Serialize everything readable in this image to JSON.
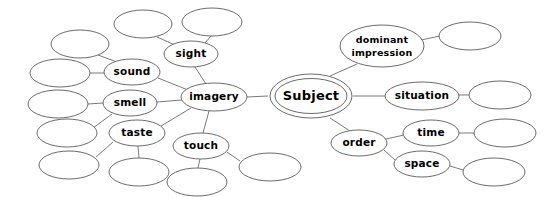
{
  "diagram": {
    "type": "mind-map",
    "background_color": "#ffffff",
    "stroke_color": "#5a5a5a",
    "edge_color": "#6b6b6b",
    "text_color": "#000000",
    "width": 558,
    "height": 197
  },
  "nodes": [
    {
      "id": "subject",
      "label": "Subject",
      "cx": 311,
      "cy": 96,
      "rx": 41,
      "ry": 22,
      "double": true,
      "size": "lg",
      "lines": [
        "Subject"
      ]
    },
    {
      "id": "imagery",
      "label": "imagery",
      "cx": 214,
      "cy": 97,
      "rx": 33,
      "ry": 14,
      "double": false,
      "size": "md",
      "lines": [
        "imagery"
      ]
    },
    {
      "id": "sight",
      "label": "sight",
      "cx": 191,
      "cy": 54,
      "rx": 27,
      "ry": 13,
      "double": false,
      "size": "md",
      "lines": [
        "sight"
      ]
    },
    {
      "id": "sound",
      "label": "sound",
      "cx": 132,
      "cy": 72,
      "rx": 28,
      "ry": 13,
      "double": false,
      "size": "md",
      "lines": [
        "sound"
      ]
    },
    {
      "id": "smell",
      "label": "smell",
      "cx": 130,
      "cy": 103,
      "rx": 27,
      "ry": 13,
      "double": false,
      "size": "md",
      "lines": [
        "smell"
      ]
    },
    {
      "id": "taste",
      "label": "taste",
      "cx": 137,
      "cy": 133,
      "rx": 28,
      "ry": 13,
      "double": false,
      "size": "md",
      "lines": [
        "taste"
      ]
    },
    {
      "id": "touch",
      "label": "touch",
      "cx": 201,
      "cy": 146,
      "rx": 28,
      "ry": 13,
      "double": false,
      "size": "md",
      "lines": [
        "touch"
      ]
    },
    {
      "id": "dominant_impression",
      "label": "dominant impression",
      "cx": 382,
      "cy": 46,
      "rx": 42,
      "ry": 21,
      "double": false,
      "size": "sm",
      "lines": [
        "dominant",
        "impression"
      ]
    },
    {
      "id": "situation",
      "label": "situation",
      "cx": 422,
      "cy": 96,
      "rx": 37,
      "ry": 14,
      "double": false,
      "size": "md",
      "lines": [
        "situation"
      ]
    },
    {
      "id": "order",
      "label": "order",
      "cx": 359,
      "cy": 143,
      "rx": 28,
      "ry": 13,
      "double": false,
      "size": "md",
      "lines": [
        "order"
      ]
    },
    {
      "id": "time",
      "label": "time",
      "cx": 431,
      "cy": 133,
      "rx": 28,
      "ry": 13,
      "double": false,
      "size": "md",
      "lines": [
        "time"
      ]
    },
    {
      "id": "space",
      "label": "space",
      "cx": 422,
      "cy": 164,
      "rx": 28,
      "ry": 13,
      "double": false,
      "size": "md",
      "lines": [
        "space"
      ]
    }
  ],
  "blank_nodes": [
    {
      "id": "blank_sight_a",
      "cx": 143,
      "cy": 24,
      "rx": 29,
      "ry": 14
    },
    {
      "id": "blank_sight_b",
      "cx": 212,
      "cy": 22,
      "rx": 30,
      "ry": 14
    },
    {
      "id": "blank_sound_a",
      "cx": 80,
      "cy": 44,
      "rx": 29,
      "ry": 14
    },
    {
      "id": "blank_sound_b",
      "cx": 60,
      "cy": 73,
      "rx": 30,
      "ry": 14
    },
    {
      "id": "blank_smell_a",
      "cx": 58,
      "cy": 104,
      "rx": 30,
      "ry": 14
    },
    {
      "id": "blank_smell_b",
      "cx": 67,
      "cy": 133,
      "rx": 30,
      "ry": 14
    },
    {
      "id": "blank_taste_a",
      "cx": 69,
      "cy": 165,
      "rx": 30,
      "ry": 14
    },
    {
      "id": "blank_taste_b",
      "cx": 139,
      "cy": 172,
      "rx": 30,
      "ry": 14
    },
    {
      "id": "blank_touch_a",
      "cx": 197,
      "cy": 182,
      "rx": 30,
      "ry": 14
    },
    {
      "id": "blank_touch_b",
      "cx": 270,
      "cy": 167,
      "rx": 31,
      "ry": 14
    },
    {
      "id": "blank_dom_a",
      "cx": 470,
      "cy": 36,
      "rx": 31,
      "ry": 14
    },
    {
      "id": "blank_situation",
      "cx": 500,
      "cy": 95,
      "rx": 31,
      "ry": 14
    },
    {
      "id": "blank_time",
      "cx": 505,
      "cy": 133,
      "rx": 31,
      "ry": 14
    },
    {
      "id": "blank_space",
      "cx": 494,
      "cy": 172,
      "rx": 31,
      "ry": 14
    }
  ],
  "edges": [
    {
      "from": "subject",
      "to": "imagery",
      "x1": 268,
      "y1": 96,
      "x2": 247,
      "y2": 97
    },
    {
      "from": "subject",
      "to": "dominant_impression",
      "x1": 330,
      "y1": 76,
      "x2": 357,
      "y2": 64
    },
    {
      "from": "subject",
      "to": "situation",
      "x1": 353,
      "y1": 96,
      "x2": 385,
      "y2": 96
    },
    {
      "from": "subject",
      "to": "order",
      "x1": 330,
      "y1": 118,
      "x2": 350,
      "y2": 131
    },
    {
      "from": "dominant_impression",
      "to": "blank_dom_a",
      "x1": 421,
      "y1": 40,
      "x2": 440,
      "y2": 36
    },
    {
      "from": "situation",
      "to": "blank_situation",
      "x1": 459,
      "y1": 95,
      "x2": 469,
      "y2": 95
    },
    {
      "from": "order",
      "to": "time",
      "x1": 386,
      "y1": 139,
      "x2": 404,
      "y2": 135
    },
    {
      "from": "order",
      "to": "space",
      "x1": 384,
      "y1": 150,
      "x2": 395,
      "y2": 160
    },
    {
      "from": "time",
      "to": "blank_time",
      "x1": 459,
      "y1": 133,
      "x2": 474,
      "y2": 133
    },
    {
      "from": "space",
      "to": "blank_space",
      "x1": 450,
      "y1": 166,
      "x2": 463,
      "y2": 170
    },
    {
      "from": "imagery",
      "to": "sight",
      "x1": 206,
      "y1": 84,
      "x2": 195,
      "y2": 67
    },
    {
      "from": "imagery",
      "to": "sound",
      "x1": 188,
      "y1": 90,
      "x2": 158,
      "y2": 78
    },
    {
      "from": "imagery",
      "to": "smell",
      "x1": 182,
      "y1": 100,
      "x2": 157,
      "y2": 102
    },
    {
      "from": "imagery",
      "to": "taste",
      "x1": 191,
      "y1": 108,
      "x2": 161,
      "y2": 126
    },
    {
      "from": "imagery",
      "to": "touch",
      "x1": 209,
      "y1": 111,
      "x2": 203,
      "y2": 133
    },
    {
      "from": "sight",
      "to": "blank_sight_a",
      "x1": 175,
      "y1": 45,
      "x2": 157,
      "y2": 37
    },
    {
      "from": "sight",
      "to": "blank_sight_b",
      "x1": 205,
      "y1": 43,
      "x2": 211,
      "y2": 36
    },
    {
      "from": "sound",
      "to": "blank_sound_a",
      "x1": 117,
      "y1": 62,
      "x2": 98,
      "y2": 55
    },
    {
      "from": "sound",
      "to": "blank_sound_b",
      "x1": 104,
      "y1": 73,
      "x2": 90,
      "y2": 73
    },
    {
      "from": "smell",
      "to": "blank_smell_a",
      "x1": 103,
      "y1": 103,
      "x2": 88,
      "y2": 104
    },
    {
      "from": "smell",
      "to": "blank_smell_b",
      "x1": 112,
      "y1": 114,
      "x2": 93,
      "y2": 128
    },
    {
      "from": "taste",
      "to": "blank_taste_a",
      "x1": 113,
      "y1": 142,
      "x2": 96,
      "y2": 157
    },
    {
      "from": "taste",
      "to": "blank_taste_b",
      "x1": 138,
      "y1": 146,
      "x2": 139,
      "y2": 158
    },
    {
      "from": "touch",
      "to": "blank_touch_a",
      "x1": 200,
      "y1": 159,
      "x2": 198,
      "y2": 168
    },
    {
      "from": "touch",
      "to": "blank_touch_b",
      "x1": 227,
      "y1": 152,
      "x2": 240,
      "y2": 161
    }
  ]
}
